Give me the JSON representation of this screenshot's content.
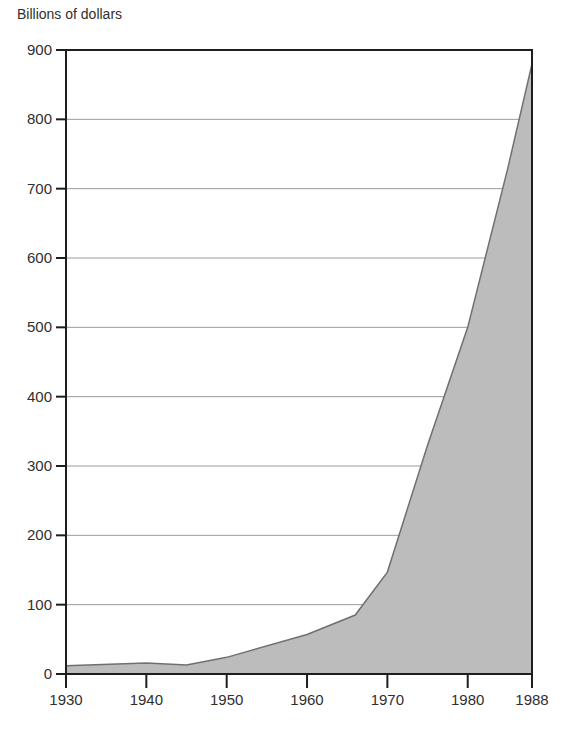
{
  "chart_data": {
    "type": "area",
    "title": "",
    "ylabel": "Billions of dollars",
    "xlabel": "",
    "ylim": [
      0,
      900
    ],
    "xlim": [
      1930,
      1988
    ],
    "grid": true,
    "legend": null,
    "y_ticks": [
      0,
      100,
      200,
      300,
      400,
      500,
      600,
      700,
      800,
      900
    ],
    "x_ticks": [
      1930,
      1940,
      1950,
      1960,
      1970,
      1980,
      1988
    ],
    "x": [
      1930,
      1940,
      1945,
      1950,
      1960,
      1966,
      1970,
      1975,
      1980,
      1985,
      1988
    ],
    "values": [
      12,
      16,
      13,
      24,
      57,
      85,
      147,
      330,
      500,
      730,
      880
    ],
    "fill_color": "#bcbcbc",
    "line_color": "#707070"
  },
  "axis": {
    "y_title": "Billions of dollars"
  }
}
